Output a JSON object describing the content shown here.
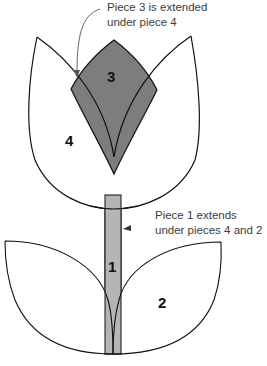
{
  "diagram": {
    "pieces": [
      {
        "id": "1",
        "label": "1",
        "name": "stem",
        "fill": "#b5b5b5"
      },
      {
        "id": "2",
        "label": "2",
        "name": "leaves",
        "fill": "#ffffff"
      },
      {
        "id": "3",
        "label": "3",
        "name": "center-petal",
        "fill": "#7d7d7d"
      },
      {
        "id": "4",
        "label": "4",
        "name": "tulip-cup",
        "fill": "#ffffff"
      }
    ],
    "callouts": {
      "piece3": {
        "line1": "Piece 3 is extended",
        "line2": "under piece 4"
      },
      "piece1": {
        "line1": "Piece 1 extends",
        "line2": "under pieces 4 and 2"
      }
    },
    "colors": {
      "outline": "#111111",
      "dark_fill": "#7d7d7d",
      "light_fill": "#b5b5b5",
      "text": "#3c3c3c"
    }
  }
}
